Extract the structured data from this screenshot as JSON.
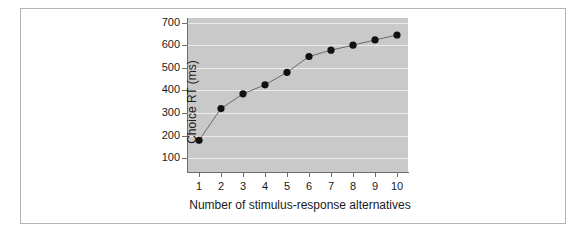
{
  "chart_data": {
    "type": "line",
    "title": "",
    "xlabel": "Number of stimulus-response alternatives",
    "ylabel": "Choice RT (ms)",
    "x": [
      1,
      2,
      3,
      4,
      5,
      6,
      7,
      8,
      9,
      10
    ],
    "values": [
      180,
      320,
      385,
      425,
      480,
      550,
      578,
      600,
      623,
      645
    ],
    "series": [
      {
        "name": "Choice RT",
        "values": [
          180,
          320,
          385,
          425,
          480,
          550,
          578,
          600,
          623,
          645
        ]
      }
    ],
    "xtick_labels": [
      "1",
      "2",
      "3",
      "4",
      "5",
      "6",
      "7",
      "8",
      "9",
      "10"
    ],
    "ytick_labels": [
      "100",
      "200",
      "300",
      "400",
      "500",
      "600",
      "700"
    ],
    "ytick_values": [
      100,
      200,
      300,
      400,
      500,
      600,
      700
    ],
    "xlim": [
      0.5,
      10.5
    ],
    "ylim": [
      40,
      720
    ],
    "grid": "horizontal",
    "legend": "none",
    "colors": {
      "plot_background": "#c9c9c9",
      "gridline": "#eceaea",
      "marker": "#111111",
      "line": "#6a6a6a",
      "axis": "#6e6e6e",
      "frame_border": "#b4b4b4",
      "page_background": "#ffffff",
      "text": "#1a1a1a"
    }
  }
}
